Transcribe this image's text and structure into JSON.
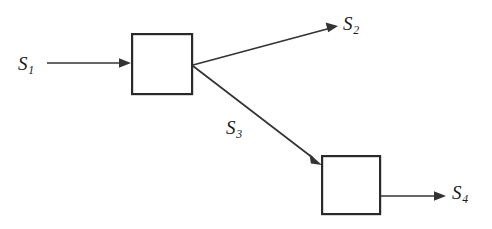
{
  "diagram": {
    "type": "block-diagram",
    "background_color": "#ffffff",
    "line_color": "#333333",
    "block_stroke_color": "#2a2a2a",
    "blocks": [
      {
        "id": "block-1",
        "label": "",
        "x": 131,
        "y": 33,
        "width": 62,
        "height": 62
      },
      {
        "id": "block-2",
        "label": "",
        "x": 321,
        "y": 155,
        "width": 60,
        "height": 60
      }
    ],
    "signals": [
      {
        "id": "s1",
        "base": "S",
        "subscript": "1",
        "text": "S1",
        "role": "input-to-block-1",
        "label_x": 18,
        "label_y": 54
      },
      {
        "id": "s2",
        "base": "S",
        "subscript": "2",
        "text": "S2",
        "role": "output-from-block-1",
        "label_x": 343,
        "label_y": 14
      },
      {
        "id": "s3",
        "base": "S",
        "subscript": "3",
        "text": "S3",
        "role": "block-1-to-block-2",
        "label_x": 226,
        "label_y": 118
      },
      {
        "id": "s4",
        "base": "S",
        "subscript": "4",
        "text": "S4",
        "role": "output-from-block-2",
        "label_x": 452,
        "label_y": 183
      }
    ]
  }
}
